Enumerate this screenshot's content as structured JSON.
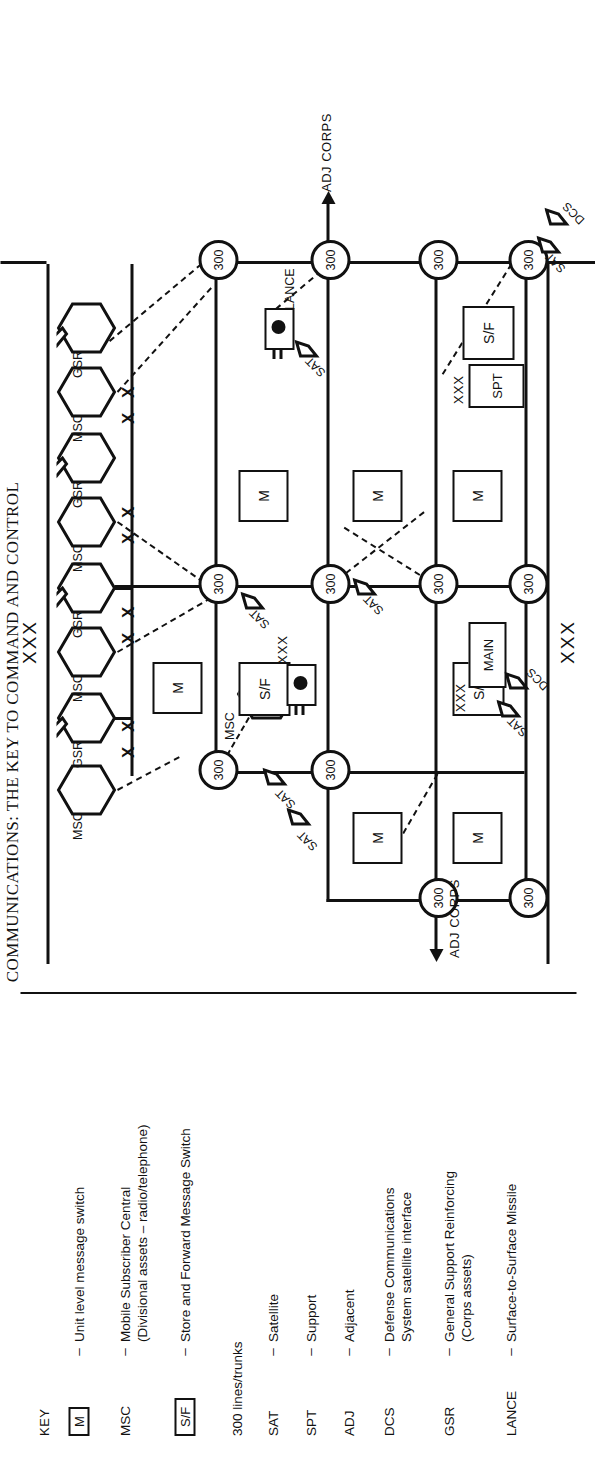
{
  "page": {
    "title_partial": "COMMUNICATIONS: THE KEY TO COMMAND AND CONTROL"
  },
  "key": {
    "heading": "KEY",
    "dash": "–",
    "items": [
      {
        "symbol": "M",
        "symbol_type": "boxed",
        "text": "Unit level message switch"
      },
      {
        "symbol": "MSC",
        "symbol_type": "plain",
        "text": "Mobile Subscriber Central",
        "text2": "(Divisional assets – radio/telephone)"
      },
      {
        "symbol": "S/F",
        "symbol_type": "boxed",
        "text": "Store and Forward Message Switch"
      },
      {
        "symbol": "",
        "symbol_type": "none",
        "text": "300 lines/trunks",
        "nodash": true
      },
      {
        "symbol": "SAT",
        "symbol_type": "plain",
        "text": "Satellite"
      },
      {
        "symbol": "SPT",
        "symbol_type": "plain",
        "text": "Support"
      },
      {
        "symbol": "ADJ",
        "symbol_type": "plain",
        "text": "Adjacent"
      },
      {
        "symbol": "DCS",
        "symbol_type": "plain",
        "text": "Defense Communications",
        "text2": "System satellite interface"
      },
      {
        "symbol": "GSR",
        "symbol_type": "plain",
        "text": "General Support Reinforcing",
        "text2": "(Corps assets)"
      },
      {
        "symbol": "LANCE",
        "symbol_type": "plain",
        "text": "Surface-to-Surface Missile"
      }
    ]
  },
  "map": {
    "node_label": "300",
    "labels": {
      "msc": "MSC",
      "gsr": "GSR",
      "sat": "SAT",
      "dcs": "DCS",
      "lance": "LANCE",
      "main": "MAIN",
      "spt": "SPT",
      "m": "M",
      "sf": "S/F",
      "xxx": "XXX",
      "xx": "X X",
      "adj_corps": "ADJ CORPS"
    },
    "nodes": [
      {
        "id": "n1",
        "label": "300"
      },
      {
        "id": "n2",
        "label": "300"
      },
      {
        "id": "n3",
        "label": "300"
      },
      {
        "id": "n4",
        "label": "300"
      },
      {
        "id": "n5",
        "label": "300"
      },
      {
        "id": "n6",
        "label": "300"
      },
      {
        "id": "n7",
        "label": "300"
      },
      {
        "id": "n8",
        "label": "300"
      },
      {
        "id": "n9",
        "label": "300"
      },
      {
        "id": "n10",
        "label": "300"
      },
      {
        "id": "n11",
        "label": "300"
      },
      {
        "id": "n12",
        "label": "300"
      }
    ],
    "boundary_labels": [
      "XXX",
      "XXX"
    ],
    "adj_corps_labels": [
      "ADJ CORPS",
      "ADJ CORPS"
    ]
  },
  "colors": {
    "ink": "#111111",
    "paper": "#ffffff"
  }
}
